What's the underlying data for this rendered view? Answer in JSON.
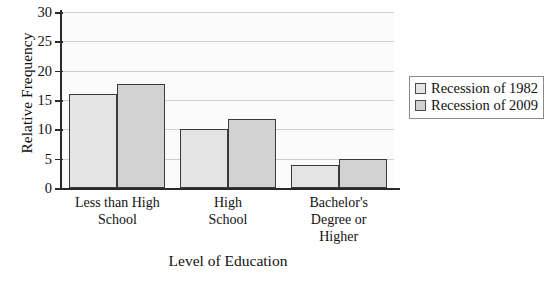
{
  "chart_data": {
    "type": "bar",
    "title": "",
    "xlabel": "Level of Education",
    "ylabel": "Relative Frequency",
    "categories": [
      "Less than High School",
      "High School",
      "Bachelor's Degree or Higher"
    ],
    "category_lines": [
      [
        "Less than High",
        "School"
      ],
      [
        "High",
        "School"
      ],
      [
        "Bachelor's",
        "Degree or",
        "Higher"
      ]
    ],
    "series": [
      {
        "name": "Recession of 1982",
        "values": [
          16,
          10,
          4
        ],
        "color": "#e4e4e4"
      },
      {
        "name": "Recession of 2009",
        "values": [
          17.8,
          11.8,
          5
        ],
        "color": "#d2d2d2"
      }
    ],
    "ylim": [
      0,
      30
    ],
    "yticks": [
      0,
      5,
      10,
      15,
      20,
      25,
      30
    ],
    "ytick_labels": [
      "0",
      "5",
      "10",
      "15",
      "20",
      "25",
      "30"
    ],
    "grid": true,
    "legend_position": "right",
    "bar_border_color": "#3a3a3a",
    "grid_color": "#d0d0d0",
    "axis_color": "#2a2a2a"
  }
}
